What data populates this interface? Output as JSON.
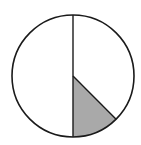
{
  "diagram": {
    "shaded_fraction": 0.125,
    "shaded_angle_degrees": 45,
    "colors": {
      "stroke": "#1a1a1a",
      "shade": "#a9a9a9",
      "background": "#ffffff"
    }
  }
}
